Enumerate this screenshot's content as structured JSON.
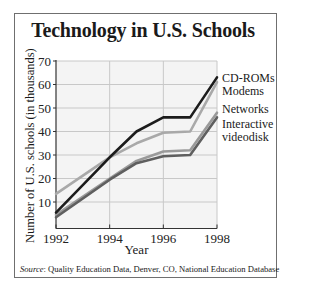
{
  "chart_data": {
    "type": "line",
    "title": "Technology in U.S. Schools",
    "xlabel": "Year",
    "ylabel": "Number of U.S. schools (in thousands)",
    "x": [
      1992,
      1994,
      1995,
      1996,
      1997,
      1998
    ],
    "xticks": [
      1992,
      1994,
      1996,
      1998
    ],
    "yticks": [
      10,
      20,
      30,
      40,
      50,
      60,
      70
    ],
    "xlim": [
      1992,
      1998
    ],
    "ylim": [
      0,
      70
    ],
    "grid": true,
    "legend_position": "right, inline labels at line ends",
    "series": [
      {
        "name": "CD-ROMs",
        "color": "#1c1c1c",
        "values": [
          5.5,
          29,
          40,
          46,
          46,
          63
        ]
      },
      {
        "name": "Modems",
        "color": "#a9a9a9",
        "values": [
          13.5,
          29,
          35,
          39.5,
          40,
          61
        ]
      },
      {
        "name": "Networks",
        "color": "#9a9a9a",
        "values": [
          4.5,
          20,
          27.5,
          31.5,
          32,
          48
        ]
      },
      {
        "name": "Interactive videodisk",
        "color": "#5f5f5f",
        "values": [
          3.5,
          19.5,
          26.5,
          29.5,
          30,
          46
        ]
      }
    ],
    "source_label": "Source",
    "source_text": ": Quality Education Data, Denver, CO, National Education Database"
  },
  "legend": {
    "cdroms": "CD-ROMs",
    "modems": "Modems",
    "networks": "Networks",
    "videodisk_line1": "Interactive",
    "videodisk_line2": "videodisk"
  }
}
